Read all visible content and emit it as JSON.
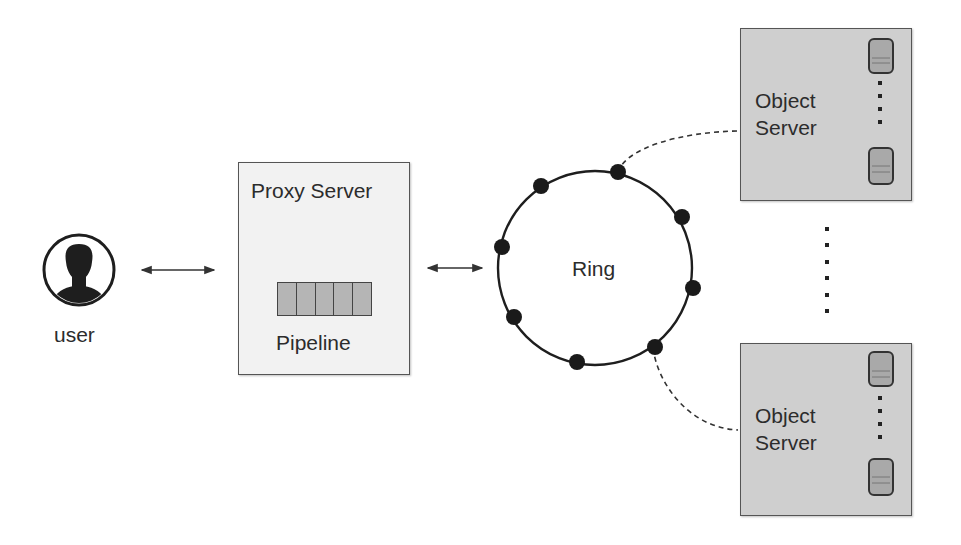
{
  "diagram": {
    "user": {
      "label": "user",
      "icon": "user-avatar-icon"
    },
    "proxy_server": {
      "title": "Proxy Server",
      "pipeline": {
        "label": "Pipeline",
        "segments": 5
      }
    },
    "ring": {
      "label": "Ring",
      "node_count": 8
    },
    "object_servers": [
      {
        "label_line1": "Object",
        "label_line2": "Server",
        "disks": 2
      },
      {
        "label_line1": "Object",
        "label_line2": "Server",
        "disks": 2
      }
    ],
    "connections": [
      {
        "from": "user",
        "to": "proxy_server",
        "style": "bidirectional-arrow"
      },
      {
        "from": "proxy_server",
        "to": "ring",
        "style": "bidirectional-arrow"
      },
      {
        "from": "ring",
        "to": "object_server_1",
        "style": "dashed"
      },
      {
        "from": "ring",
        "to": "object_server_2",
        "style": "dashed"
      }
    ],
    "colors": {
      "box_fill": "#f2f2f2",
      "object_box_fill": "#cfcfcf",
      "pipeline_fill": "#b5b5b5",
      "node_fill": "#1a1a1a",
      "line": "#222222"
    }
  }
}
